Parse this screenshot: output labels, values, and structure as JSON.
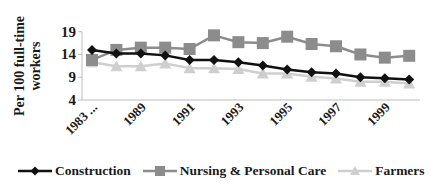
{
  "chart_data": {
    "type": "line",
    "title": "",
    "xlabel": "",
    "ylabel": "Per 100 full-time workers",
    "ylim": [
      4,
      19
    ],
    "yticks": [
      4,
      9,
      14,
      19
    ],
    "grid": false,
    "legend_position": "bottom",
    "categories": [
      "1983 ...",
      "1988",
      "1989",
      "1990",
      "1991",
      "1992",
      "1993",
      "1994",
      "1995",
      "1996",
      "1997",
      "1998",
      "1999",
      "2000"
    ],
    "visible_x_tick_labels": [
      "1983 ...",
      "1989",
      "1991",
      "1993",
      "1995",
      "1997",
      "1999"
    ],
    "series": [
      {
        "name": "Construction",
        "color": "#111111",
        "marker": "diamond",
        "values": [
          15.0,
          14.2,
          14.2,
          13.8,
          12.8,
          12.8,
          12.3,
          11.6,
          10.7,
          10.1,
          9.8,
          9.0,
          8.8,
          8.5
        ]
      },
      {
        "name": "Nursing & Personal Care",
        "color": "#8c8c8c",
        "marker": "square",
        "values": [
          12.8,
          15.0,
          15.5,
          15.5,
          15.2,
          18.2,
          16.7,
          16.5,
          17.9,
          16.3,
          15.8,
          14.0,
          13.3,
          13.7
        ]
      },
      {
        "name": "Farmers",
        "color": "#cfcfcf",
        "marker": "triangle",
        "values": [
          12.3,
          11.4,
          11.4,
          12.0,
          11.0,
          11.0,
          10.8,
          9.8,
          9.8,
          9.1,
          8.7,
          8.0,
          8.0,
          7.6
        ]
      }
    ]
  },
  "legend": {
    "items": [
      {
        "label": "Construction"
      },
      {
        "label": "Nursing & Personal Care"
      },
      {
        "label": "Farmers"
      }
    ]
  },
  "axis": {
    "y_title_line1": "Per 100 full-time",
    "y_title_line2": "workers"
  }
}
